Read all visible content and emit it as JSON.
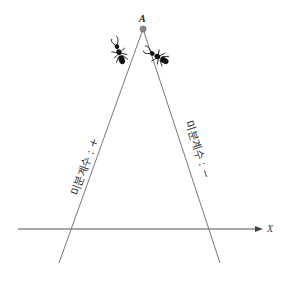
{
  "diagram": {
    "title": "",
    "point_label": "A",
    "axis_label": "X",
    "left_side_label": "미분계수 : +",
    "right_side_label": "미분계수 : −",
    "colors": {
      "line": "#777777",
      "axis": "#555555",
      "point": "#888888",
      "ant": "#111111"
    },
    "icons": {
      "left_ant": "ant-climbing-left",
      "right_ant": "ant-climbing-right",
      "arrow": "arrow-right"
    }
  }
}
